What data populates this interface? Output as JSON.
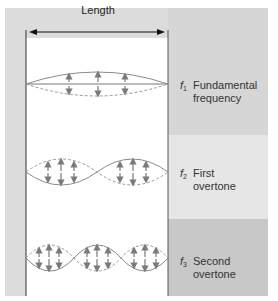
{
  "length_label": "Length",
  "colors": {
    "left_panel_bg": "#dcdcdc",
    "band_top": "#d6d6d6",
    "band_middle": "#e6e6e6",
    "band_bottom": "#c8c8c8",
    "tube_bg": "#ffffff",
    "wave_line": "#8a8a8a",
    "arrow": "#7a7a7a",
    "wall": "#333333"
  },
  "modes": [
    {
      "symbol": "f",
      "subscript": "1",
      "line1": "Fundamental",
      "line2": "frequency",
      "loops": 1
    },
    {
      "symbol": "f",
      "subscript": "2",
      "line1": "First",
      "line2": "overtone",
      "loops": 2
    },
    {
      "symbol": "f",
      "subscript": "3",
      "line1": "Second",
      "line2": "overtone",
      "loops": 3
    }
  ]
}
